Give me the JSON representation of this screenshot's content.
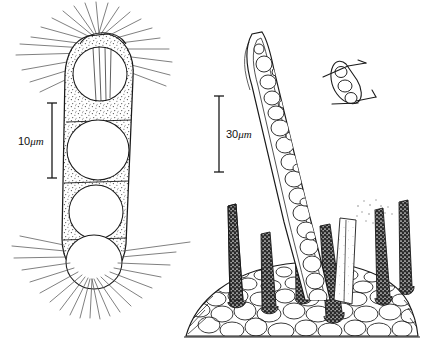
{
  "figure": {
    "domain": "scientific-line-drawing",
    "background_color": "#ffffff",
    "ink_color": "#1a1a1a",
    "ray_color": "#555555",
    "stipple_color": "#4a4a4a",
    "width": 442,
    "height": 348
  },
  "panels": [
    {
      "id": "left-panel",
      "name": "four-celled-capsule-with-radiating-spines",
      "scale_bar": {
        "value": "10",
        "unit": "μm",
        "label": "10μm",
        "x": 52,
        "y_top": 103,
        "y_bottom": 178,
        "cap_half_width": 5
      },
      "capsule": {
        "cell_count": 4,
        "septa_count": 3,
        "texture": "stippled",
        "apex_spines": 20,
        "basal_spines": 26
      }
    },
    {
      "id": "right-panel",
      "name": "curved-filament-on-spiny-substrate",
      "scale_bar": {
        "value": "30",
        "unit": "μm",
        "label": "30μm",
        "x": 219,
        "y_top": 96,
        "y_bottom": 172,
        "cap_half_width": 5
      },
      "filament": {
        "orientation": "curved-upright",
        "cell_count": 22,
        "sheath": "double-outlined"
      },
      "substrate": {
        "name": "cobblestone-tissue-dome",
        "cell_count": 78,
        "baseline_y": 336
      },
      "spines": {
        "count": 7,
        "fill": "dark-stippled",
        "shape": "tapered"
      },
      "pale_column": {
        "name": "translucent-column",
        "texture": "faint-stipple-cloud"
      }
    },
    {
      "id": "inset-panel",
      "name": "detached-filament-segment-inset",
      "cell_count": 3,
      "arrow_count": 2
    }
  ]
}
